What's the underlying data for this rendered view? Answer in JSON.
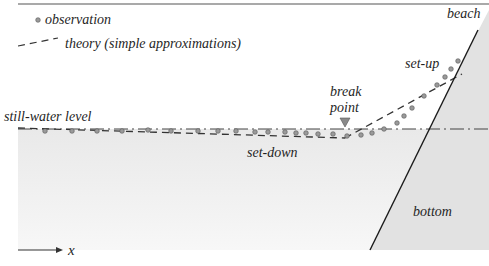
{
  "legend": {
    "observation": {
      "label": "observation",
      "marker": "circle-marker"
    },
    "theory": {
      "label": "theory (simple approximations)",
      "marker": "dashed-line"
    }
  },
  "labels": {
    "still_water_level": "still-water level",
    "break_line1": "break",
    "break_line2": "point",
    "set_down": "set-down",
    "set_up": "set-up",
    "beach": "beach",
    "bottom": "bottom",
    "x_axis": "x"
  },
  "colors": {
    "water": "#eeeeee",
    "land": "#e4e4e4",
    "line": "#222222",
    "observation_fill": "#9a9a9a",
    "triangle": "#8a8a8a"
  },
  "observations": [
    [
      45,
      131
    ],
    [
      72,
      131
    ],
    [
      97,
      131
    ],
    [
      122,
      131
    ],
    [
      148,
      130
    ],
    [
      171,
      131
    ],
    [
      198,
      131
    ],
    [
      218,
      131
    ],
    [
      236,
      131
    ],
    [
      255,
      132
    ],
    [
      268,
      132
    ],
    [
      285,
      132
    ],
    [
      296,
      133
    ],
    [
      306,
      133
    ],
    [
      318,
      134
    ],
    [
      333,
      134
    ],
    [
      347,
      136
    ],
    [
      361,
      135
    ],
    [
      372,
      133
    ],
    [
      384,
      129
    ],
    [
      397,
      123
    ],
    [
      404,
      116
    ],
    [
      412,
      108
    ],
    [
      424,
      96
    ],
    [
      437,
      85
    ],
    [
      445,
      77
    ],
    [
      451,
      69
    ],
    [
      458,
      61
    ]
  ]
}
